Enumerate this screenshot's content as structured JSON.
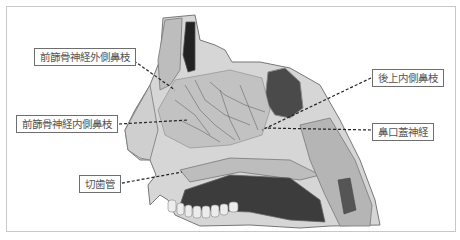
{
  "figure": {
    "colors": {
      "frame": "#c8c8c8",
      "label_border": "#6e6e6e",
      "label_text": "#555555",
      "leader": "#222222",
      "tissue_light": "#d9d9d9",
      "tissue_mid": "#a9a9a9",
      "tissue_dark": "#3a3a3a"
    }
  },
  "labels": [
    {
      "id": "anterior-ethmoidal-lateral",
      "text": "前篩骨神経外側鼻枝",
      "x": 34,
      "y": 48
    },
    {
      "id": "anterior-ethmoidal-medial",
      "text": "前篩骨神経内側鼻枝",
      "x": 16,
      "y": 115
    },
    {
      "id": "incisive-canal",
      "text": "切歯管",
      "x": 79,
      "y": 175
    },
    {
      "id": "posterior-superior-medial",
      "text": "後上内側鼻枝",
      "x": 372,
      "y": 69
    },
    {
      "id": "nasopalatine-nerve",
      "text": "鼻口蓋神経",
      "x": 372,
      "y": 123
    }
  ]
}
